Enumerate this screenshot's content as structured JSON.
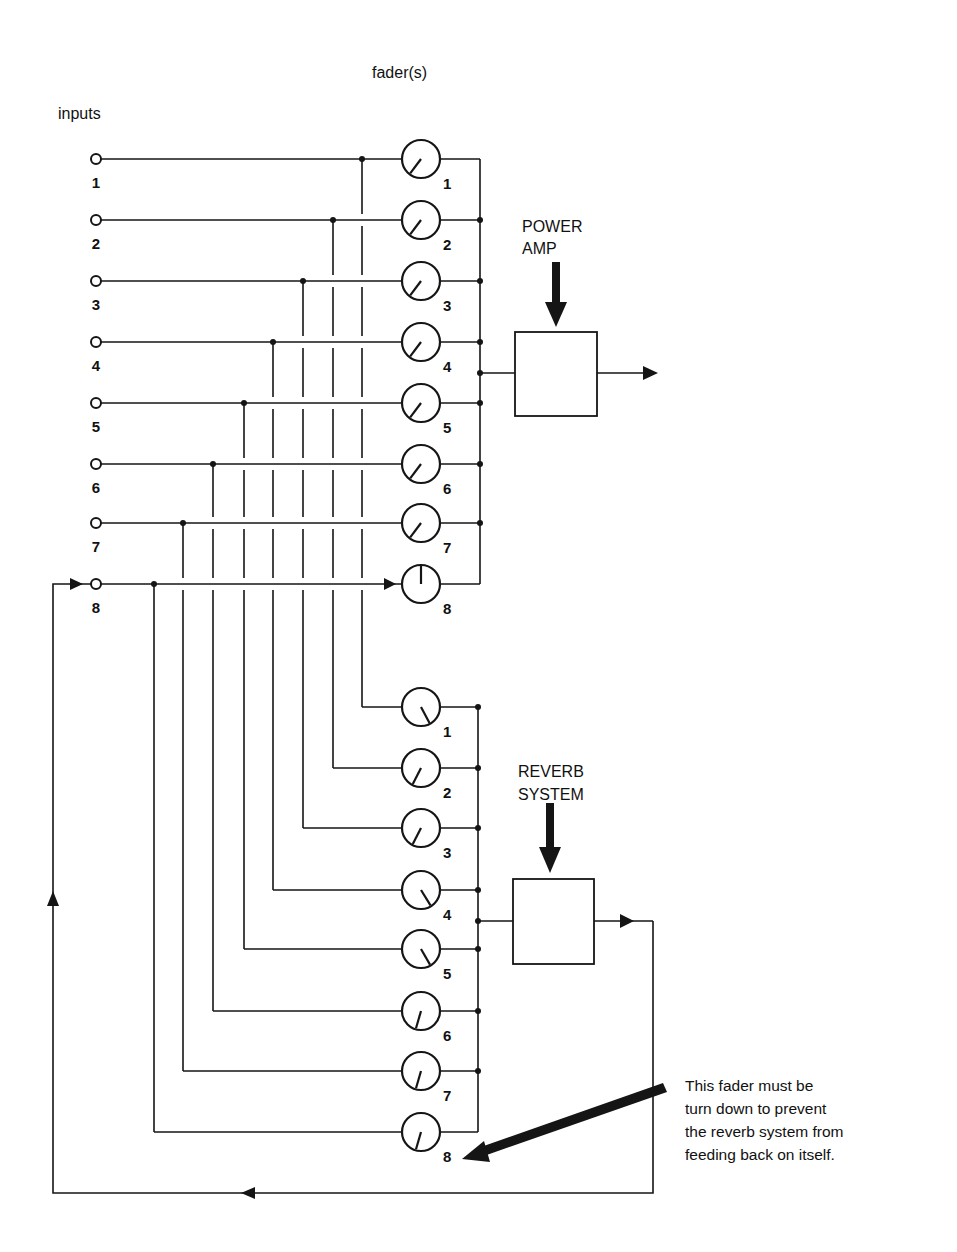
{
  "title": "fader(s)",
  "inputs_label": "inputs",
  "inputs": [
    {
      "label": "1"
    },
    {
      "label": "2"
    },
    {
      "label": "3"
    },
    {
      "label": "4"
    },
    {
      "label": "5"
    },
    {
      "label": "6"
    },
    {
      "label": "7"
    },
    {
      "label": "8"
    }
  ],
  "main_bus": {
    "faders": [
      {
        "label": "1",
        "pointer_angle": 217
      },
      {
        "label": "2",
        "pointer_angle": 217
      },
      {
        "label": "3",
        "pointer_angle": 217
      },
      {
        "label": "4",
        "pointer_angle": 217
      },
      {
        "label": "5",
        "pointer_angle": 217
      },
      {
        "label": "6",
        "pointer_angle": 217
      },
      {
        "label": "7",
        "pointer_angle": 217
      },
      {
        "label": "8",
        "pointer_angle": 0
      }
    ],
    "destination": {
      "line1": "POWER",
      "line2": "AMP"
    }
  },
  "reverb_bus": {
    "faders": [
      {
        "label": "1",
        "pointer_angle": 152
      },
      {
        "label": "2",
        "pointer_angle": 207
      },
      {
        "label": "3",
        "pointer_angle": 207
      },
      {
        "label": "4",
        "pointer_angle": 148
      },
      {
        "label": "5",
        "pointer_angle": 150
      },
      {
        "label": "6",
        "pointer_angle": 196
      },
      {
        "label": "7",
        "pointer_angle": 196
      },
      {
        "label": "8",
        "pointer_angle": 196
      }
    ],
    "destination": {
      "line1": "REVERB",
      "line2": "SYSTEM"
    }
  },
  "annotation": {
    "lines": [
      "This fader must be",
      "turn down to prevent",
      "the reverb system from",
      "feeding back on itself."
    ]
  }
}
